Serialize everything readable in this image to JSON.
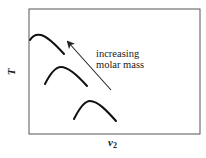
{
  "diagram": {
    "type": "phase-diagram-sketch",
    "frame": {
      "x": 29,
      "y": 9,
      "width": 171,
      "height": 125,
      "stroke": "#555555"
    },
    "axes": {
      "x_label": "v",
      "x_label_subscript": "2",
      "y_label": "T"
    },
    "annotation": {
      "line1": "increasing",
      "line2": "molar mass"
    },
    "arrow": {
      "from": [
        111,
        90
      ],
      "to": [
        66,
        40
      ],
      "color": "#222222"
    },
    "curves": [
      {
        "name": "curve-high-molar-mass",
        "start": [
          30,
          40
        ],
        "peak": [
          39,
          35
        ],
        "end": [
          64,
          54
        ]
      },
      {
        "name": "curve-mid-molar-mass",
        "start": [
          45,
          84
        ],
        "peak": [
          61,
          67
        ],
        "end": [
          87,
          86
        ]
      },
      {
        "name": "curve-low-molar-mass",
        "start": [
          74,
          119
        ],
        "peak": [
          90,
          101
        ],
        "end": [
          116,
          121
        ]
      }
    ],
    "curve_color": "#111111"
  }
}
